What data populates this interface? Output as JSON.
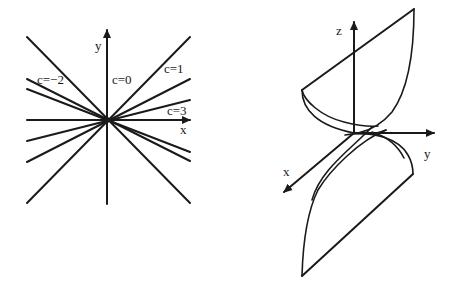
{
  "left_figure": {
    "description": "Level curves z = c of z = y/x : lines through origin y = c x",
    "axes": {
      "x_label": "x",
      "y_label": "y"
    },
    "labels": [
      {
        "text": "c=−2",
        "x": 38,
        "y": 83
      },
      {
        "text": "c=0",
        "x": 112,
        "y": 83
      },
      {
        "text": "c=1",
        "x": 164,
        "y": 72
      },
      {
        "text": "c=3",
        "x": 167,
        "y": 114
      }
    ]
  },
  "right_figure": {
    "description": "Surface z = y/x (saddle-like ruled surface)",
    "axes": {
      "x_label": "x",
      "y_label": "y",
      "z_label": "z"
    }
  }
}
